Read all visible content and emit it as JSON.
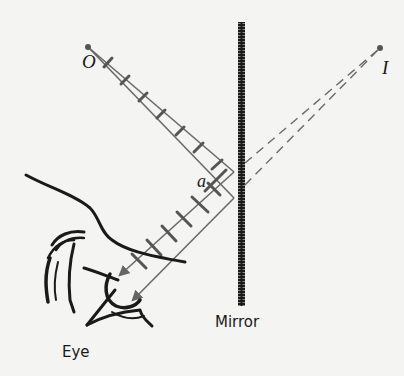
{
  "diagram": {
    "labels": {
      "object": "O",
      "image": "I",
      "angle": "a",
      "mirror": "Mirror",
      "eye": "Eye"
    },
    "colors": {
      "background": "#f4f4f2",
      "ink": "#1a1a1a",
      "ray": "#6a6a6a",
      "wavefront": "#555555"
    },
    "elements": [
      {
        "name": "object-point",
        "label": "O",
        "x": 88,
        "y": 47
      },
      {
        "name": "image-point",
        "label": "I",
        "x": 380,
        "y": 48
      },
      {
        "name": "mirror",
        "label": "Mirror",
        "x": 241,
        "y_top": 22,
        "y_bottom": 306
      },
      {
        "name": "eye",
        "label": "Eye"
      }
    ]
  }
}
